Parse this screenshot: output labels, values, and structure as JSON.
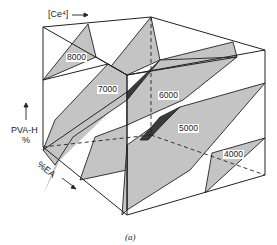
{
  "figure": {
    "caption": "(a)",
    "axes": {
      "x_label": "[Ce⁴]",
      "y_label_line1": "PVA-H",
      "y_label_line2": "%",
      "z_label": "%EA"
    },
    "isosurfaces": [
      {
        "label": "8000"
      },
      {
        "label": "7000"
      },
      {
        "label": "6000"
      },
      {
        "label": "5000"
      },
      {
        "label": "4000"
      }
    ],
    "colors": {
      "plane_fill": "#c4c4c4",
      "dark_fill": "#3a3a3a",
      "line": "#222222",
      "background": "#ffffff"
    }
  }
}
